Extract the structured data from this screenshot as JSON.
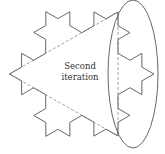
{
  "diagram": {
    "label_lines": [
      "Second",
      "iteration"
    ],
    "iteration": 2,
    "base_triangle": {
      "left_vertex": [
        9.5,
        74
      ],
      "top_right_vertex": [
        118,
        12
      ],
      "bottom_right_vertex": [
        118,
        136
      ]
    },
    "highlight_ellipse": {
      "cx": 133,
      "cy": 74,
      "rx": 25,
      "ry": 74
    },
    "colors": {
      "outline": "#555555",
      "dashed": "#777777",
      "ellipse": "#555555",
      "text": "#333333",
      "background": "#ffffff"
    }
  }
}
